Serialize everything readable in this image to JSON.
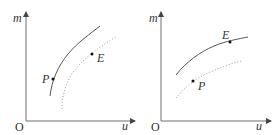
{
  "figure": {
    "panels": [
      {
        "id": "left",
        "y_axis_label": "m",
        "x_axis_label": "u",
        "origin_label": "O",
        "points": [
          {
            "label": "P",
            "on": "solid-curve"
          },
          {
            "label": "E",
            "on": "near-dotted-curve"
          }
        ],
        "curves": [
          {
            "style": "solid",
            "description": "steep concave curve"
          },
          {
            "style": "dotted",
            "description": "parallel concave curve below/right"
          }
        ]
      },
      {
        "id": "right",
        "y_axis_label": "m",
        "x_axis_label": "u",
        "origin_label": "O",
        "points": [
          {
            "label": "E",
            "on": "solid-curve"
          },
          {
            "label": "P",
            "on": "near-dotted-curve"
          }
        ],
        "curves": [
          {
            "style": "solid",
            "description": "flatter concave curve"
          },
          {
            "style": "dotted",
            "description": "parallel concave curve below"
          }
        ]
      }
    ],
    "colors": {
      "axis": "#6e6e6e",
      "solid_curve": "#555555",
      "dotted_curve": "#a8a8a8",
      "point": "#111111",
      "text": "#333333"
    }
  }
}
